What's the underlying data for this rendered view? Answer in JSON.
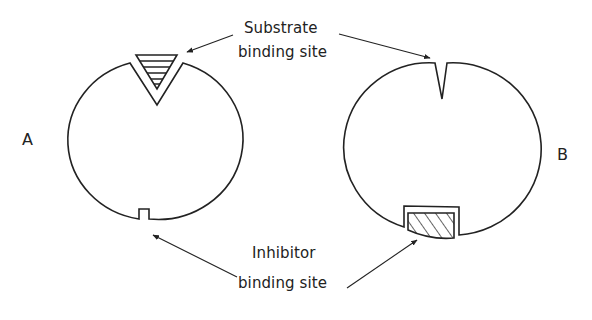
{
  "diagram": {
    "type": "enzyme-binding-sites",
    "colors": {
      "stroke": "#222222",
      "background": "#ffffff"
    },
    "enzymes": [
      {
        "id": "A",
        "label": "A",
        "substrate_site": "V-shaped notch at top, occupied by hatched triangular substrate",
        "inhibitor_site": "small empty rectangular notch at bottom"
      },
      {
        "id": "B",
        "label": "B",
        "substrate_site": "narrow closed V-shaped slit at top (distorted, empty)",
        "inhibitor_site": "rectangular notch at bottom occupied by hatched inhibitor"
      }
    ],
    "labels": {
      "substrate_line1": "Substrate",
      "substrate_line2": "binding site",
      "inhibitor_line1": "Inhibitor",
      "inhibitor_line2": "binding site"
    },
    "arrows": [
      {
        "from": "substrate-label",
        "to": "enzyme-A-substrate-site"
      },
      {
        "from": "substrate-label",
        "to": "enzyme-B-substrate-site"
      },
      {
        "from": "inhibitor-label",
        "to": "enzyme-A-inhibitor-site"
      },
      {
        "from": "inhibitor-label",
        "to": "enzyme-B-inhibitor-site"
      }
    ]
  }
}
